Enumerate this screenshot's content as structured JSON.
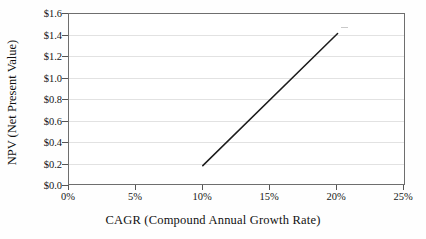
{
  "chart_data": {
    "type": "line",
    "title": "",
    "xlabel": "CAGR (Compound Annual Growth Rate)",
    "ylabel": "NPV (Net Present Value)",
    "xlim": [
      0,
      25
    ],
    "ylim": [
      0.0,
      1.6
    ],
    "x_tick_labels": [
      "0%",
      "5%",
      "10%",
      "15%",
      "20%",
      "25%"
    ],
    "x_tick_values": [
      0,
      5,
      10,
      15,
      20,
      25
    ],
    "y_tick_labels": [
      "$0.0",
      "$0.2",
      "$0.4",
      "$0.6",
      "$0.8",
      "$1.0",
      "$1.2",
      "$1.4",
      "$1.6"
    ],
    "y_tick_values": [
      0.0,
      0.2,
      0.4,
      0.6,
      0.8,
      1.0,
      1.2,
      1.4,
      1.6
    ],
    "grid": "horizontal",
    "legend": "none",
    "series": [
      {
        "name": "NPV",
        "color": "#1c1c1c",
        "x": [
          10,
          20
        ],
        "values": [
          0.18,
          1.41
        ]
      }
    ]
  },
  "axes": {
    "y_title": "NPV (Net Present Value)",
    "x_title": "CAGR (Compound Annual Growth Rate)"
  },
  "colors": {
    "line": "#1c1c1c",
    "grid": "#e2e2e2",
    "frame": "#6e6e6e",
    "plot_background": "#ffffff",
    "page_background": "#fefefe"
  }
}
